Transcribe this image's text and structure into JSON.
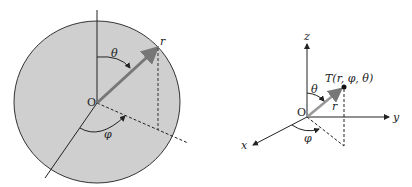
{
  "left_diagram": {
    "origin_label": "O",
    "polar_angle_label": "θ",
    "azimuth_angle_label": "φ",
    "radius_label": "r",
    "fill_color": "#cfcfcf"
  },
  "right_diagram": {
    "origin_label": "O",
    "z_label": "z",
    "y_label": "y",
    "x_label": "x",
    "point_label": "T(r, φ, θ)",
    "polar_angle_label": "θ",
    "azimuth_angle_label": "φ",
    "radius_label": "r"
  }
}
